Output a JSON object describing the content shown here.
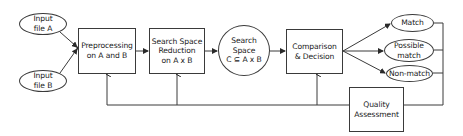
{
  "diagram": {
    "type": "flowchart",
    "colors": {
      "stroke": "#3a3a3a",
      "fill": "#ffffff",
      "text": "#1a1a1a"
    },
    "nodes": {
      "input_a": {
        "shape": "ellipse",
        "label": "Input\nfile A"
      },
      "input_b": {
        "shape": "ellipse",
        "label": "Input\nfile B"
      },
      "preprocessing": {
        "shape": "rectangle",
        "label": "Preprocessing\non A and B"
      },
      "reduction": {
        "shape": "rectangle",
        "label": "Search Space\nReduction\non A x B"
      },
      "search_space": {
        "shape": "circle",
        "label": "Search Space\nC ⊆ A x B"
      },
      "comparison": {
        "shape": "rectangle",
        "label": "Comparison\n& Decision"
      },
      "match": {
        "shape": "ellipse",
        "label": "Match"
      },
      "possible_match": {
        "shape": "ellipse",
        "label": "Possible\nmatch"
      },
      "non_match": {
        "shape": "ellipse",
        "label": "Non-match"
      },
      "quality": {
        "shape": "rectangle",
        "label": "Quality\nAssessment"
      }
    },
    "edges": [
      {
        "from": "input_a",
        "to": "preprocessing"
      },
      {
        "from": "input_b",
        "to": "preprocessing"
      },
      {
        "from": "preprocessing",
        "to": "reduction"
      },
      {
        "from": "reduction",
        "to": "search_space"
      },
      {
        "from": "search_space",
        "to": "comparison"
      },
      {
        "from": "comparison",
        "to": "match"
      },
      {
        "from": "comparison",
        "to": "possible_match"
      },
      {
        "from": "comparison",
        "to": "non_match"
      },
      {
        "from": "match",
        "to": "quality"
      },
      {
        "from": "possible_match",
        "to": "quality"
      },
      {
        "from": "non_match",
        "to": "quality"
      },
      {
        "from": "quality",
        "to": "comparison"
      },
      {
        "from": "quality",
        "to": "reduction"
      },
      {
        "from": "quality",
        "to": "preprocessing"
      }
    ]
  }
}
